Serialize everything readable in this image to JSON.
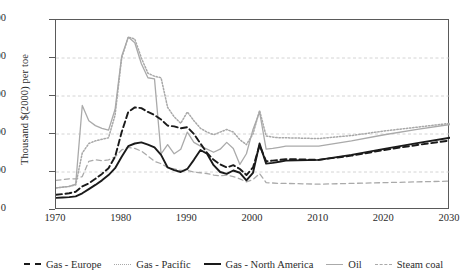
{
  "chart_data": {
    "type": "line",
    "title": "",
    "xlabel": "",
    "ylabel": "Thousand $(2000) per toe",
    "xlim": [
      1970,
      2030
    ],
    "ylim": [
      0,
      500
    ],
    "xticks": [
      1970,
      1980,
      1990,
      2000,
      2010,
      2020,
      2030
    ],
    "yticks": [
      0,
      100,
      200,
      300,
      400,
      500
    ],
    "grid": "horizontal-dashed",
    "legend_position": "bottom",
    "series": [
      {
        "name": "Gas - Europe",
        "style": "dashed",
        "color": "#1a1a1a",
        "x": [
          1970,
          1971,
          1972,
          1973,
          1974,
          1975,
          1976,
          1977,
          1978,
          1979,
          1980,
          1981,
          1982,
          1983,
          1984,
          1985,
          1986,
          1987,
          1988,
          1989,
          1990,
          1991,
          1992,
          1993,
          1994,
          1995,
          1996,
          1997,
          1998,
          1999,
          2000,
          2001,
          2002,
          2003,
          2004,
          2005,
          2010,
          2015,
          2020,
          2025,
          2030
        ],
        "values": [
          40,
          42,
          44,
          48,
          62,
          70,
          82,
          95,
          110,
          140,
          205,
          258,
          270,
          268,
          258,
          250,
          238,
          222,
          220,
          215,
          218,
          200,
          175,
          150,
          132,
          120,
          112,
          118,
          108,
          92,
          112,
          170,
          128,
          130,
          132,
          134,
          132,
          143,
          158,
          171,
          183
        ]
      },
      {
        "name": "Gas - Pacific",
        "style": "dotted",
        "color": "#a8a8a8",
        "x": [
          1970,
          1971,
          1972,
          1973,
          1974,
          1975,
          1976,
          1977,
          1978,
          1979,
          1980,
          1981,
          1982,
          1983,
          1984,
          1985,
          1986,
          1987,
          1988,
          1989,
          1990,
          1991,
          1992,
          1993,
          1994,
          1995,
          1996,
          1997,
          1998,
          1999,
          2000,
          2001,
          2002,
          2003,
          2004,
          2005,
          2010,
          2015,
          2020,
          2025,
          2030
        ],
        "values": [
          58,
          60,
          62,
          66,
          150,
          175,
          182,
          186,
          190,
          250,
          400,
          455,
          450,
          400,
          360,
          352,
          348,
          270,
          245,
          228,
          258,
          235,
          215,
          205,
          198,
          205,
          212,
          205,
          185,
          172,
          200,
          262,
          195,
          192,
          190,
          190,
          188,
          196,
          208,
          218,
          228
        ]
      },
      {
        "name": "Gas - North America",
        "style": "solid",
        "color": "#1a1a1a",
        "x": [
          1970,
          1971,
          1972,
          1973,
          1974,
          1975,
          1976,
          1977,
          1978,
          1979,
          1980,
          1981,
          1982,
          1983,
          1984,
          1985,
          1986,
          1987,
          1988,
          1989,
          1990,
          1991,
          1992,
          1993,
          1994,
          1995,
          1996,
          1997,
          1998,
          1999,
          2000,
          2001,
          2002,
          2003,
          2004,
          2005,
          2010,
          2015,
          2020,
          2025,
          2030
        ],
        "values": [
          32,
          33,
          34,
          36,
          44,
          55,
          66,
          78,
          92,
          110,
          140,
          168,
          175,
          178,
          172,
          165,
          145,
          112,
          105,
          100,
          108,
          132,
          158,
          148,
          118,
          100,
          95,
          104,
          98,
          78,
          98,
          175,
          122,
          124,
          127,
          130,
          132,
          145,
          161,
          176,
          190
        ]
      },
      {
        "name": "Oil",
        "style": "solid",
        "color": "#aaaaaa",
        "x": [
          1970,
          1971,
          1972,
          1973,
          1974,
          1975,
          1976,
          1977,
          1978,
          1979,
          1980,
          1981,
          1982,
          1983,
          1984,
          1985,
          1986,
          1987,
          1988,
          1989,
          1990,
          1991,
          1992,
          1993,
          1994,
          1995,
          1996,
          1997,
          1998,
          1999,
          2000,
          2001,
          2002,
          2003,
          2004,
          2005,
          2010,
          2015,
          2020,
          2025,
          2030
        ],
        "values": [
          58,
          60,
          62,
          68,
          275,
          235,
          222,
          215,
          210,
          265,
          405,
          455,
          440,
          385,
          348,
          345,
          148,
          172,
          148,
          160,
          205,
          178,
          168,
          160,
          152,
          160,
          178,
          162,
          120,
          148,
          212,
          258,
          160,
          162,
          165,
          168,
          168,
          182,
          198,
          212,
          225
        ]
      },
      {
        "name": "Steam coal",
        "style": "dashed",
        "color": "#aaaaaa",
        "x": [
          1970,
          1971,
          1972,
          1973,
          1974,
          1975,
          1976,
          1977,
          1978,
          1979,
          1980,
          1981,
          1982,
          1983,
          1984,
          1985,
          1986,
          1987,
          1988,
          1989,
          1990,
          1991,
          1992,
          1993,
          1994,
          1995,
          1996,
          1997,
          1998,
          1999,
          2000,
          2001,
          2002,
          2003,
          2004,
          2005,
          2010,
          2015,
          2020,
          2025,
          2030
        ],
        "values": [
          78,
          80,
          82,
          82,
          88,
          128,
          132,
          130,
          132,
          140,
          158,
          165,
          162,
          155,
          142,
          128,
          122,
          112,
          108,
          104,
          104,
          100,
          98,
          96,
          92,
          90,
          92,
          88,
          82,
          74,
          80,
          96,
          72,
          71,
          70,
          70,
          68,
          70,
          72,
          74,
          76
        ]
      }
    ]
  },
  "axes": {
    "y_title": "Thousand $(2000) per toe",
    "y_tick_labels": [
      "0",
      "100",
      "200",
      "300",
      "400",
      "500"
    ],
    "x_tick_labels": [
      "1970",
      "1980",
      "1990",
      "2000",
      "2010",
      "2020",
      "2030"
    ]
  },
  "legend": {
    "items": [
      {
        "label": "Gas - Europe",
        "swatch": "dashed-black-line-icon"
      },
      {
        "label": "Gas - Pacific",
        "swatch": "dotted-gray-line-icon"
      },
      {
        "label": "Gas - North America",
        "swatch": "solid-black-line-icon"
      },
      {
        "label": "Oil",
        "swatch": "solid-gray-line-icon"
      },
      {
        "label": "Steam coal",
        "swatch": "dashed-gray-line-icon"
      }
    ]
  }
}
